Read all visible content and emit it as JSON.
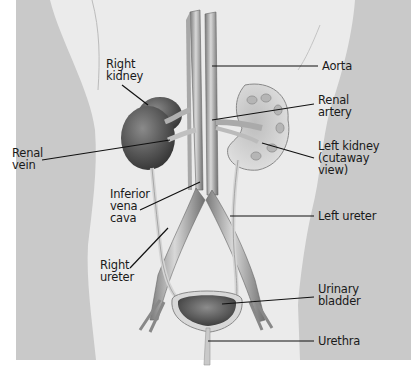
{
  "diagram": {
    "colors": {
      "background": "#c9c9c9",
      "torso": "#ebebeb",
      "bottom_band": "#ffffff",
      "kidney_dark": "#5a5a5a",
      "vessel": "#9a9a9a",
      "leader_line": "#111111",
      "text": "#1a1a1a"
    },
    "labels": [
      {
        "id": "right-kidney",
        "text": "Right\nkidney"
      },
      {
        "id": "aorta",
        "text": "Aorta"
      },
      {
        "id": "renal-artery",
        "text": "Renal\nartery"
      },
      {
        "id": "renal-vein",
        "text": "Renal\nvein"
      },
      {
        "id": "left-kidney",
        "text": "Left kidney\n(cutaway\nview)"
      },
      {
        "id": "inferior-vena-cava",
        "text": "Inferior\nvena\ncava"
      },
      {
        "id": "left-ureter",
        "text": "Left ureter"
      },
      {
        "id": "right-ureter",
        "text": "Right\nureter"
      },
      {
        "id": "urinary-bladder",
        "text": "Urinary\nbladder"
      },
      {
        "id": "urethra",
        "text": "Urethra"
      }
    ]
  }
}
